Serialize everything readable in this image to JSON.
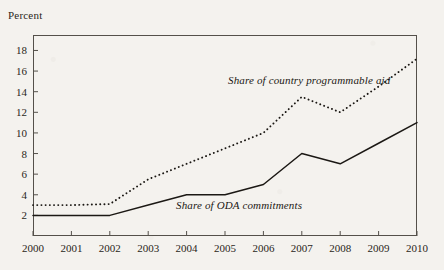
{
  "chart_data": {
    "type": "line",
    "title": "",
    "xlabel": "",
    "ylabel": "Percent",
    "ylim": [
      0,
      19.5
    ],
    "yticks": [
      2,
      4,
      6,
      8,
      10,
      12,
      14,
      16,
      18
    ],
    "grid": false,
    "legend_position": "inline-annotation",
    "categories": [
      "2000",
      "2001",
      "2002",
      "2003",
      "2004",
      "2005",
      "2006",
      "2007",
      "2008",
      "2009",
      "2010"
    ],
    "x": [
      2000,
      2001,
      2002,
      2003,
      2004,
      2005,
      2006,
      2007,
      2008,
      2009,
      2010
    ],
    "series": [
      {
        "name": "Share of country programmable aid",
        "style": "dotted",
        "color": "#1b1814",
        "values": [
          3.0,
          3.0,
          3.1,
          5.5,
          7.0,
          8.5,
          10.0,
          13.5,
          12.0,
          14.5,
          17.2
        ]
      },
      {
        "name": "Share of ODA commitments",
        "style": "solid",
        "color": "#1b1814",
        "values": [
          2.0,
          2.0,
          2.0,
          3.0,
          4.0,
          4.0,
          5.0,
          8.0,
          7.0,
          9.0,
          11.0
        ]
      }
    ],
    "annotations": [
      {
        "text": "Share of country programmable aid",
        "for": "Share of country programmable aid"
      },
      {
        "text": "Share of ODA commitments",
        "for": "Share of ODA commitments"
      }
    ]
  },
  "axis": {
    "y_label": "Percent",
    "y_tick_labels": [
      "18",
      "16",
      "14",
      "12",
      "10",
      "8",
      "6",
      "4",
      "2"
    ],
    "x_tick_labels": [
      "2000",
      "2001",
      "2002",
      "2003",
      "2004",
      "2005",
      "2006",
      "2007",
      "2008",
      "2009",
      "2010"
    ]
  },
  "labels": {
    "cpa": "Share of country programmable aid",
    "oda": "Share of ODA commitments"
  }
}
